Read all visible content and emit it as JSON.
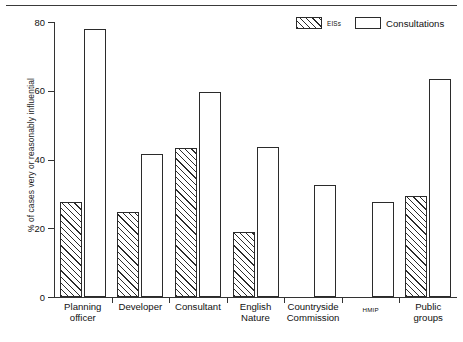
{
  "chart_data": {
    "type": "bar",
    "title": "",
    "xlabel": "",
    "ylabel": "% of cases very or reasonably influential",
    "ylim": [
      0,
      80
    ],
    "yticks": [
      0,
      20,
      40,
      60,
      80
    ],
    "grid": false,
    "legend_position": "top-right",
    "categories": [
      "Planning officer",
      "Developer",
      "Consultant",
      "English Nature",
      "Countryside Commission",
      "HMIP",
      "Public groups"
    ],
    "category_lines": [
      [
        "Planning",
        "officer"
      ],
      [
        "Developer",
        ""
      ],
      [
        "Consultant",
        ""
      ],
      [
        "English",
        "Nature"
      ],
      [
        "Countryside",
        "Commission"
      ],
      [
        "HMIP",
        ""
      ],
      [
        "Public",
        "groups"
      ]
    ],
    "series": [
      {
        "name": "EISs",
        "fill": "hatched",
        "values": [
          27.6,
          24.7,
          43.3,
          18.9,
          null,
          null,
          29.3
        ]
      },
      {
        "name": "Consultations",
        "fill": "open",
        "values": [
          78.0,
          41.6,
          59.5,
          43.7,
          32.7,
          27.6,
          63.3
        ]
      }
    ]
  },
  "axis": {
    "y_title": "% of cases very or reasonably influential",
    "y_tick_labels": [
      "0",
      "20",
      "40",
      "60",
      "80"
    ]
  },
  "legend": {
    "items": [
      {
        "label": "EISs",
        "style": "hatched"
      },
      {
        "label": "Consultations",
        "style": "open"
      }
    ]
  },
  "colors": {
    "line": "#2b2b2b",
    "text": "#111111",
    "background": "#ffffff"
  }
}
